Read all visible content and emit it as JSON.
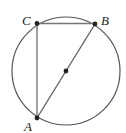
{
  "diagram": {
    "type": "geometry",
    "circle": {
      "cx": 66,
      "cy": 71,
      "r": 54
    },
    "points": [
      {
        "name": "C",
        "label": "C",
        "x": 37,
        "y": 23,
        "label_x": 23,
        "label_y": 24
      },
      {
        "name": "B",
        "label": "B",
        "x": 95,
        "y": 24,
        "label_x": 101,
        "label_y": 25
      },
      {
        "name": "A",
        "label": "A",
        "x": 37,
        "y": 118,
        "label_x": 25,
        "label_y": 131
      },
      {
        "name": "O",
        "label": "",
        "x": 66,
        "y": 71
      }
    ],
    "segments": [
      {
        "from": "C",
        "to": "B"
      },
      {
        "from": "C",
        "to": "A"
      },
      {
        "from": "A",
        "to": "B"
      }
    ],
    "colors": {
      "stroke": "#555555",
      "point": "#222222",
      "label": "#222222"
    }
  }
}
